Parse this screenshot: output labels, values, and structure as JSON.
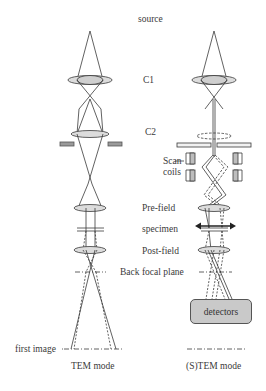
{
  "labels": {
    "source": "source",
    "c1": "C1",
    "c2": "C2",
    "scan_line1": "Scan",
    "scan_line2": "coils",
    "prefield": "Pre-field",
    "specimen": "specimen",
    "postfield": "Post-field",
    "bfp": "Back focal plane",
    "first_image": "first image",
    "detectors": "detectors",
    "tem_mode": "TEM mode",
    "stem_mode": "(S)TEM mode"
  },
  "colors": {
    "line": "#3a3a3a",
    "lens_fill": "#cfcfcf",
    "detector_fill": "#c9c9c9"
  }
}
